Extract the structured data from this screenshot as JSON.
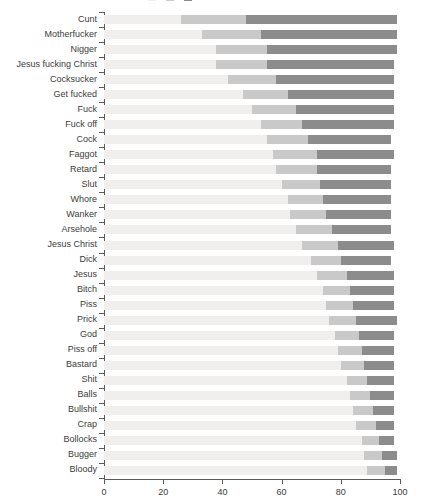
{
  "chart_data": {
    "type": "bar",
    "subtype": "stacked-horizontal-percent",
    "title": "",
    "xlabel": "",
    "ylabel": "",
    "xlim": [
      0,
      100
    ],
    "xticks": [
      0,
      20,
      40,
      60,
      80,
      100
    ],
    "grid": false,
    "legend_position": "top",
    "legend_visible_partial": true,
    "colors": {
      "segment_light": "#f0efee",
      "segment_medium": "#c9c9c9",
      "segment_dark": "#8c8c8c",
      "axis": "#5a5a5a",
      "text": "#3c3c3c",
      "background": "#ffffff"
    },
    "categories": [
      "Cunt",
      "Motherfucker",
      "Nigger",
      "Jesus fucking Christ",
      "Cocksucker",
      "Get fucked",
      "Fuck",
      "Fuck off",
      "Cock",
      "Faggot",
      "Retard",
      "Slut",
      "Whore",
      "Wanker",
      "Arsehole",
      "Jesus Christ",
      "Dick",
      "Jesus",
      "Bitch",
      "Piss",
      "Prick",
      "God",
      "Piss off",
      "Bastard",
      "Shit",
      "Balls",
      "Bullshit",
      "Crap",
      "Bollocks",
      "Bugger",
      "Bloody"
    ],
    "series": [
      {
        "name": "series-1",
        "color": "#f0efee",
        "values": [
          26,
          33,
          38,
          38,
          42,
          47,
          50,
          53,
          55,
          57,
          58,
          60,
          62,
          63,
          65,
          67,
          70,
          72,
          74,
          75,
          76,
          78,
          79,
          80,
          82,
          83,
          84,
          85,
          87,
          88,
          89
        ]
      },
      {
        "name": "series-2",
        "color": "#c9c9c9",
        "values": [
          22,
          20,
          17,
          17,
          16,
          15,
          15,
          14,
          14,
          15,
          14,
          13,
          12,
          12,
          12,
          12,
          10,
          10,
          9,
          9,
          9,
          8,
          8,
          8,
          7,
          7,
          7,
          7,
          6,
          6,
          6
        ]
      },
      {
        "name": "series-3",
        "color": "#8c8c8c",
        "values": [
          51,
          46,
          44,
          43,
          40,
          36,
          33,
          31,
          28,
          26,
          25,
          24,
          23,
          22,
          20,
          19,
          17,
          16,
          15,
          14,
          14,
          12,
          11,
          10,
          9,
          8,
          7,
          6,
          5,
          5,
          4
        ]
      }
    ]
  },
  "legend": {
    "entries": [
      {
        "label": "",
        "color": "#f0efee"
      },
      {
        "label": "",
        "color": "#c9c9c9"
      },
      {
        "label": "",
        "color": "#8c8c8c"
      }
    ]
  }
}
